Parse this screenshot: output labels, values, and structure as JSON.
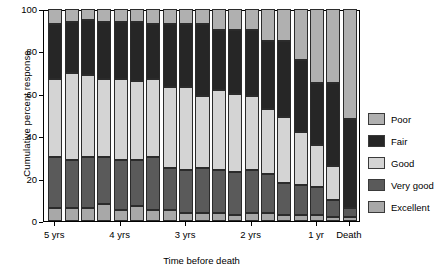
{
  "chart_data": {
    "type": "bar",
    "subtype": "stacked-bar-cumulative",
    "title": "",
    "xlabel": "Time before death",
    "ylabel": "Cumulative percent response",
    "ylim": [
      0,
      100
    ],
    "ytick_values": [
      0,
      20,
      40,
      60,
      80,
      100
    ],
    "ytick_labels": [
      "0",
      "20",
      "40",
      "60",
      "80",
      "100"
    ],
    "grid": false,
    "legend_position": "right",
    "stack_order_bottom_to_top": [
      "Excellent",
      "Very good",
      "Good",
      "Fair",
      "Poor"
    ],
    "categories": [
      "5 yrs",
      "",
      "",
      "",
      "4 yrs",
      "",
      "",
      "",
      "3 yrs",
      "",
      "",
      "",
      "2 yrs",
      "",
      "",
      "",
      "1 yr",
      "",
      "Death"
    ],
    "xtick_labels": [
      "5 yrs",
      "4 yrs",
      "3 yrs",
      "2 yrs",
      "1 yr",
      "Death"
    ],
    "series": [
      {
        "name": "Excellent",
        "color": "#a8a8a8",
        "values": [
          6,
          6,
          6,
          8,
          5,
          7,
          5,
          5,
          4,
          4,
          4,
          3,
          4,
          4,
          3,
          3,
          3,
          2,
          2
        ]
      },
      {
        "name": "Very good",
        "color": "#5a5a5a",
        "values": [
          24,
          23,
          24,
          22,
          24,
          22,
          25,
          20,
          20,
          21,
          20,
          20,
          20,
          18,
          15,
          14,
          13,
          8,
          4
        ]
      },
      {
        "name": "Good",
        "color": "#d4d4d4",
        "values": [
          37,
          41,
          39,
          37,
          38,
          37,
          37,
          38,
          39,
          34,
          38,
          37,
          35,
          31,
          31,
          25,
          20,
          16,
          0
        ]
      },
      {
        "name": "Fair",
        "color": "#262626",
        "values": [
          26,
          24,
          26,
          27,
          27,
          28,
          26,
          30,
          30,
          34,
          28,
          30,
          31,
          32,
          36,
          34,
          29,
          39,
          42
        ]
      },
      {
        "name": "Poor",
        "color": "#b0b0b0",
        "values": [
          7,
          6,
          5,
          6,
          6,
          6,
          7,
          7,
          7,
          7,
          10,
          10,
          10,
          15,
          15,
          24,
          35,
          35,
          52
        ]
      }
    ]
  },
  "legend": {
    "items": [
      {
        "label": "Poor",
        "color": "#b0b0b0"
      },
      {
        "label": "Fair",
        "color": "#262626"
      },
      {
        "label": "Good",
        "color": "#d4d4d4"
      },
      {
        "label": "Very good",
        "color": "#5a5a5a"
      },
      {
        "label": "Excellent",
        "color": "#a8a8a8"
      }
    ]
  }
}
